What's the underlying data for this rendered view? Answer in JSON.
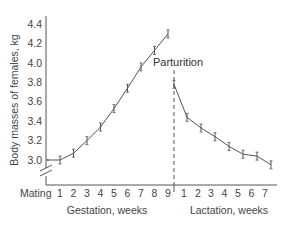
{
  "chart_data": {
    "type": "line",
    "title": "",
    "ylabel": "Body masses of females, kg",
    "xlabel_gestation": "Gestation, weeks",
    "xlabel_lactation": "Lactation, weeks",
    "ylim": [
      2.8,
      4.45
    ],
    "y_ticks": [
      "3.0",
      "3.2",
      "3.4",
      "3.6",
      "3.8",
      "4.0",
      "4.2",
      "4.4"
    ],
    "y_axis_break": true,
    "grid": false,
    "legend": null,
    "annotation": "Parturition",
    "x_first_label": "Mating",
    "series": [
      {
        "name": "Gestation",
        "categories": [
          "Mating",
          "1",
          "2",
          "3",
          "4",
          "5",
          "6",
          "7",
          "8",
          "9"
        ],
        "values": [
          3.0,
          3.0,
          3.07,
          3.2,
          3.34,
          3.53,
          3.74,
          3.96,
          4.13,
          4.3
        ],
        "error_bars": true
      },
      {
        "name": "Lactation",
        "categories": [
          "Parturition",
          "1",
          "2",
          "3",
          "4",
          "5",
          "6",
          "7"
        ],
        "values": [
          3.78,
          3.44,
          3.33,
          3.24,
          3.14,
          3.06,
          3.04,
          2.95
        ],
        "error_bars": true
      }
    ]
  },
  "labels": {
    "ylabel": "Body masses of females, kg",
    "gestation": "Gestation, weeks",
    "lactation": "Lactation, weeks",
    "parturition": "Parturition",
    "mating": "Mating"
  },
  "colors": {
    "line": "#555555",
    "axis": "#555555",
    "text": "#444444"
  }
}
